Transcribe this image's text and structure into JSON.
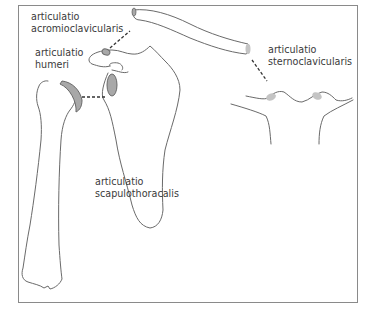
{
  "figure": {
    "type": "anatomical-diagram",
    "colors": {
      "outline": "#6a6a6a",
      "joint_fill": "#a8a8a8",
      "joint_fill_light": "#c4c4c4",
      "frame": "#8a8a8a",
      "text": "#3a3a3a"
    },
    "labels": {
      "acromioclavicular": {
        "line1": "articulatio",
        "line2": "acromioclavicularis"
      },
      "humeri": {
        "line1": "articulatio",
        "line2": "humeri"
      },
      "sternoclavicular": {
        "line1": "articulatio",
        "line2": "sternoclavicularis"
      },
      "scapulothoracic": {
        "line1": "articulatio",
        "line2": "scapulothoracalis"
      }
    },
    "structures": [
      "humerus",
      "scapula",
      "clavicle",
      "sternum"
    ]
  }
}
